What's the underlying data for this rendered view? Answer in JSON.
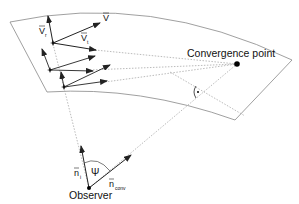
{
  "diagram": {
    "labels": {
      "convergence_point": "Convergence point",
      "observer": "Observer",
      "v_total": "V",
      "v_r": "V",
      "v_r_sub": "r",
      "v_t": "V",
      "v_t_sub": "t",
      "n_i": "n",
      "n_i_sub": "i",
      "n_conv": "n",
      "n_conv_sub": "conv",
      "psi": "Ψ"
    },
    "colors": {
      "line": "#222222",
      "outline": "#888888",
      "dotted": "#999999"
    }
  }
}
